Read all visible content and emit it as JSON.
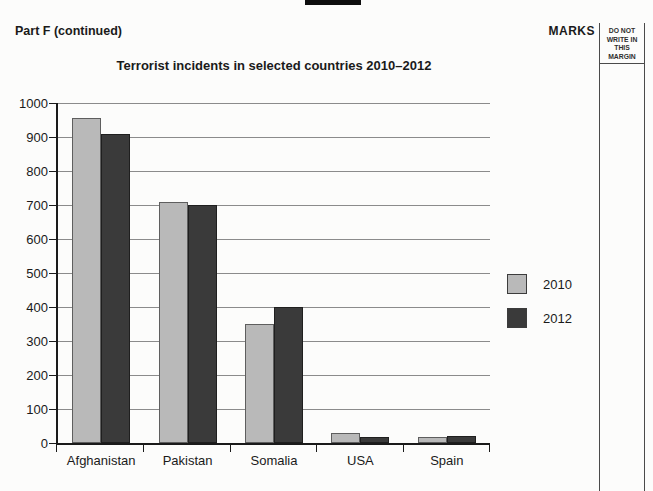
{
  "page": {
    "part_header": "Part F (continued)",
    "marks_label": "MARKS",
    "margin_note": "DO NOT WRITE IN THIS MARGIN"
  },
  "chart_data": {
    "type": "bar",
    "title": "Terrorist incidents in selected countries 2010–2012",
    "categories": [
      "Afghanistan",
      "Pakistan",
      "Somalia",
      "USA",
      "Spain"
    ],
    "series": [
      {
        "name": "2010",
        "color": "#b9b9b9",
        "values": [
          955,
          710,
          350,
          30,
          18
        ]
      },
      {
        "name": "2012",
        "color": "#3a3a3a",
        "values": [
          910,
          700,
          400,
          18,
          22
        ]
      }
    ],
    "xlabel": "",
    "ylabel": "",
    "ylim": [
      0,
      1000
    ],
    "ytick_interval": 100,
    "yticks": [
      0,
      100,
      200,
      300,
      400,
      500,
      600,
      700,
      800,
      900,
      1000
    ],
    "grid": true,
    "legend_position": "right"
  }
}
